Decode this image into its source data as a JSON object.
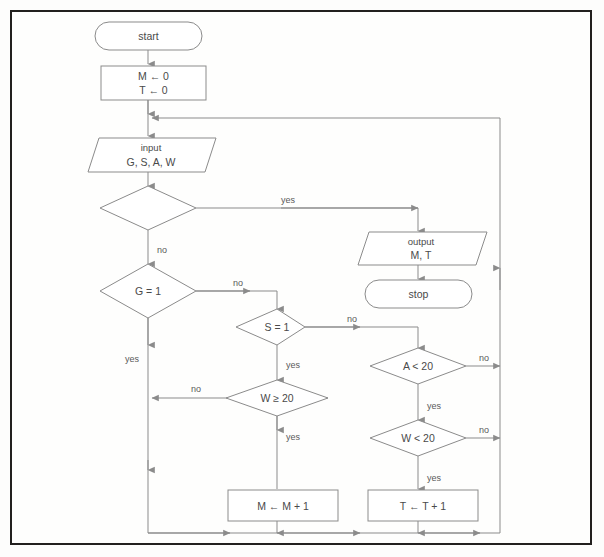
{
  "diagram": {
    "frame_color": "#22201e",
    "shape_stroke": "#8b8b8b",
    "text_color": "#4a4a4a",
    "background": "#fefefd",
    "nodes": {
      "start": {
        "label": "start",
        "type": "terminator"
      },
      "init": {
        "line1": "M ← 0",
        "line2": "T ← 0",
        "type": "process"
      },
      "input": {
        "line1": "input",
        "line2": "G, S, A, W",
        "type": "io"
      },
      "decision_blank": {
        "label": "",
        "type": "decision"
      },
      "output": {
        "line1": "output",
        "line2": "M, T",
        "type": "io"
      },
      "stop": {
        "label": "stop",
        "type": "terminator"
      },
      "g_test": {
        "label": "G = 1",
        "type": "decision"
      },
      "s_test": {
        "label": "S = 1",
        "type": "decision"
      },
      "w_ge_test": {
        "label": "W ≥ 20",
        "type": "decision"
      },
      "a_test": {
        "label": "A < 20",
        "type": "decision"
      },
      "w_lt_test": {
        "label": "W < 20",
        "type": "decision"
      },
      "m_inc": {
        "label": "M ← M + 1",
        "type": "process"
      },
      "t_inc": {
        "label": "T ← T + 1",
        "type": "process"
      }
    },
    "edge_labels": {
      "blank_yes": "yes",
      "blank_no": "no",
      "g_no": "no",
      "g_yes": "yes",
      "s_no": "no",
      "s_yes": "yes",
      "wge_no": "no",
      "wge_yes": "yes",
      "a_no": "no",
      "a_yes": "yes",
      "wlt_no": "no",
      "wlt_yes": "yes"
    }
  }
}
